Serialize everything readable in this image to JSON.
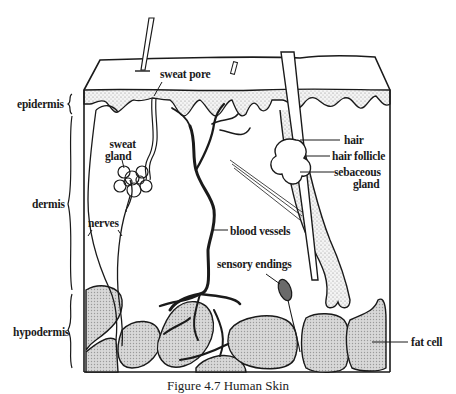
{
  "figure": {
    "caption": "Figure 4.7   Human Skin"
  },
  "layers": [
    {
      "id": "epidermis",
      "label": "epidermis"
    },
    {
      "id": "dermis",
      "label": "dermis"
    },
    {
      "id": "hypodermis",
      "label": "hypodermis"
    }
  ],
  "structures": {
    "sweat_pore": "sweat pore",
    "sweat_gland_line1": "sweat",
    "sweat_gland_line2": "gland",
    "nerves": "nerves",
    "blood_vessels": "blood vessels",
    "sensory_endings": "sensory endings",
    "hair": "hair",
    "hair_follicle": "hair follicle",
    "sebaceous_gland_line1": "sebaceous",
    "sebaceous_gland_line2": "gland",
    "fat_cell": "fat cell"
  },
  "colors": {
    "ink": "#1a1a1a",
    "background": "#ffffff",
    "stipple": "#bdbdbd",
    "fat_fill": "#cfcfcf"
  }
}
